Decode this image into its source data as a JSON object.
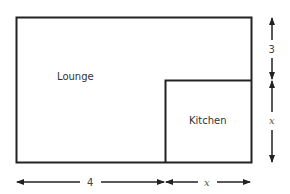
{
  "diagram": {
    "type": "floor-plan",
    "rooms": [
      {
        "name": "Lounge",
        "label": "Lounge"
      },
      {
        "name": "Kitchen",
        "label": "Kitchen"
      }
    ],
    "dimensions": {
      "bottom_left": {
        "label": "4"
      },
      "bottom_right": {
        "label": "x"
      },
      "right_top": {
        "label": "3"
      },
      "right_bottom": {
        "label": "x"
      }
    },
    "colors": {
      "stroke": "#222222",
      "background": "#ffffff"
    }
  }
}
